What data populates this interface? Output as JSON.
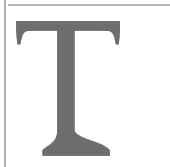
{
  "page": {
    "width": 170,
    "height": 167,
    "background_color": "#ffffff"
  },
  "rules": {
    "top_rule": {
      "name": "top-horizontal-rule",
      "color": "#b5b5b5",
      "x": 8,
      "y": 4,
      "length": 162,
      "thickness": 1.5
    },
    "left_rule": {
      "name": "left-vertical-rule",
      "color": "#aeaeae",
      "x": 4,
      "y": 0,
      "length": 167,
      "thickness": 1.5
    }
  },
  "dropcap": {
    "character": "T",
    "style": "serif-slab-bracketed",
    "fill_color": "#6e6e6e",
    "bounds": {
      "left": 16,
      "top": 21,
      "right": 120,
      "bottom": 156
    },
    "metrics": {
      "crossbar_left": 16,
      "crossbar_right": 120,
      "crossbar_top": 21,
      "crossbar_bottom": 31,
      "serif_drop_bottom": 45,
      "stem_left": 57,
      "stem_right": 74,
      "stem_bottom": 140,
      "foot_left": 42,
      "foot_right": 110,
      "foot_bottom": 156
    }
  }
}
